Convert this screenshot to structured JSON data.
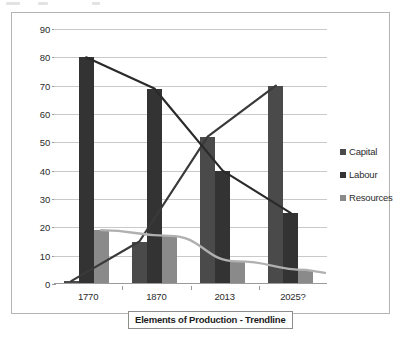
{
  "chart_data": {
    "type": "bar",
    "title": "Elements of Production - Trendline",
    "xlabel": "",
    "ylabel": "",
    "categories": [
      "1770",
      "1870",
      "2013",
      "2025?"
    ],
    "series": [
      {
        "name": "Capital",
        "values": [
          1,
          15,
          52,
          70
        ],
        "color": "#4a4a4a"
      },
      {
        "name": "Labour",
        "values": [
          80,
          69,
          40,
          25
        ],
        "color": "#333333"
      },
      {
        "name": "Resources",
        "values": [
          19,
          17,
          8,
          5
        ],
        "color": "#8a8a8a"
      }
    ],
    "trendlines": [
      {
        "name": "Capital trendline",
        "values": [
          1,
          15,
          52,
          70
        ],
        "color": "#3a3a3a",
        "style": "straight"
      },
      {
        "name": "Labour trendline",
        "values": [
          80,
          69,
          40,
          25
        ],
        "color": "#2a2a2a",
        "style": "straight"
      },
      {
        "name": "Resources trendline",
        "values": [
          19,
          17,
          8,
          5
        ],
        "color": "#b0b0b0",
        "style": "smooth"
      }
    ],
    "ylim": [
      0,
      90
    ],
    "ytick_step": 10,
    "yticks": [
      "90",
      "80",
      "70",
      "60",
      "50",
      "40",
      "30",
      "20",
      "10",
      "0"
    ],
    "grid": true,
    "legend_position": "right"
  },
  "legend": {
    "items": [
      {
        "label": "Capital",
        "color": "#4a4a4a"
      },
      {
        "label": "Labour",
        "color": "#333333"
      },
      {
        "label": "Resources",
        "color": "#8a8a8a"
      }
    ]
  },
  "colors": {
    "capital": "#4a4a4a",
    "labour": "#333333",
    "resources": "#8a8a8a",
    "grid": "#c9c9c9",
    "frame": "#b4b4b4",
    "text": "#2b2b2b"
  }
}
